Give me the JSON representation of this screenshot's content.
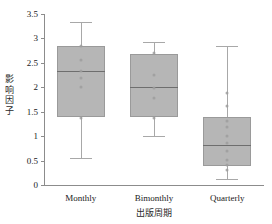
{
  "chart_data": {
    "type": "box",
    "title": "",
    "xlabel": "出版周期",
    "ylabel": "影响因子",
    "ylabel_chars": [
      "影",
      "响",
      "因",
      "子"
    ],
    "categories": [
      "Monthly",
      "Bimonthly",
      "Quarterly"
    ],
    "ylim": [
      0,
      3.5
    ],
    "yticks": [
      0,
      0.5,
      1,
      1.5,
      2,
      2.5,
      3,
      3.5
    ],
    "ytick_labels": [
      "0",
      "0.5",
      "1",
      "1.5",
      "2",
      "2.5",
      "3",
      "3.5"
    ],
    "grid": false,
    "legend": "none",
    "box_color": "#b6b6b6",
    "box_edge_color": "#9a9a9a",
    "median_color": "#6e6e6e",
    "whisker_color": "#a8a8a8",
    "point_color": "#9d9d9d",
    "axis_color": "#8c8c8c",
    "boxes": [
      {
        "category": "Monthly",
        "whisker_low": 0.55,
        "q1": 1.4,
        "median": 2.33,
        "q3": 2.85,
        "whisker_high": 3.33,
        "points": [
          2.85,
          2.55,
          2.33,
          2.18,
          2.0,
          1.38
        ]
      },
      {
        "category": "Bimonthly",
        "whisker_low": 1.0,
        "q1": 1.4,
        "median": 2.0,
        "q3": 2.69,
        "whisker_high": 2.92,
        "points": [
          2.7,
          2.25,
          1.98,
          1.78,
          1.38
        ]
      },
      {
        "category": "Quarterly",
        "whisker_low": 0.13,
        "q1": 0.38,
        "median": 0.81,
        "q3": 1.4,
        "whisker_high": 2.85,
        "points": [
          1.88,
          1.62,
          1.32,
          1.18,
          1.0,
          0.85,
          0.7,
          0.52,
          0.4,
          0.3
        ]
      }
    ]
  }
}
